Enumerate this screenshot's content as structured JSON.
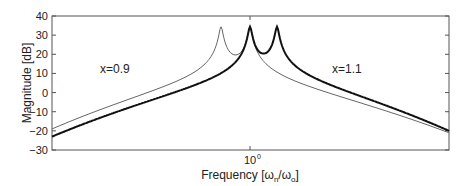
{
  "chart_data": {
    "type": "line",
    "title": "",
    "xlabel": "Frequency [ω_n/ω_o]",
    "xlabel_parts": {
      "main": "Frequency [ω",
      "sub1": "n",
      "mid": "/ω",
      "sub2": "o",
      "end": "]"
    },
    "ylabel": "Magnitude  [dB]",
    "xscale": "log",
    "xticks": [
      {
        "label_base": "10",
        "label_exp": "0",
        "value": 1
      }
    ],
    "yticks": [
      40,
      30,
      20,
      10,
      0,
      -10,
      -20,
      -30
    ],
    "ylim": [
      -30,
      40
    ],
    "grid": false,
    "annotations": [
      {
        "text": "x=0.9",
        "x_px": 100,
        "y_px": 73
      },
      {
        "text": "x=1.1",
        "x_px": 332,
        "y_px": 73
      }
    ],
    "series": [
      {
        "name": "x=0.9",
        "style": "thin",
        "color": "#666666",
        "points_db": [
          [
            -2.8,
            -19
          ],
          [
            -2,
            -15
          ],
          [
            -1.2,
            -8
          ],
          [
            -0.6,
            3
          ],
          [
            -0.25,
            18
          ],
          [
            -0.08,
            34
          ],
          [
            0,
            26
          ],
          [
            0.06,
            30
          ],
          [
            0.1,
            34
          ],
          [
            0.25,
            18
          ],
          [
            0.6,
            2
          ],
          [
            1.2,
            -10
          ],
          [
            2,
            -16
          ],
          [
            2.8,
            -21
          ]
        ]
      },
      {
        "name": "x=1.1",
        "style": "thick",
        "color": "#111111",
        "points_db": [
          [
            -2.8,
            -23
          ],
          [
            -2,
            -19
          ],
          [
            -1.2,
            -12
          ],
          [
            -0.6,
            -1
          ],
          [
            -0.25,
            14
          ],
          [
            0,
            34
          ],
          [
            0.05,
            28
          ],
          [
            0.1,
            34
          ],
          [
            0.25,
            17
          ],
          [
            0.6,
            3
          ],
          [
            1.2,
            -9
          ],
          [
            2,
            -15
          ],
          [
            2.8,
            -20
          ]
        ]
      }
    ]
  }
}
